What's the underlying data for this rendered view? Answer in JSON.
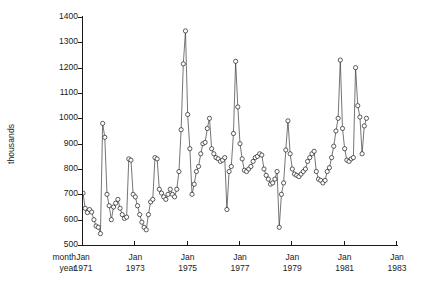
{
  "chart_data": {
    "type": "line",
    "title": "",
    "subtitle": "",
    "xlabel": "",
    "ylabel": "thousands",
    "row_labels": [
      "month",
      "year"
    ],
    "grid": false,
    "legend": "none",
    "markers": "open-circle",
    "ylim": [
      500,
      1400
    ],
    "yticks": [
      500,
      600,
      700,
      800,
      900,
      1000,
      1100,
      1200,
      1300,
      1400
    ],
    "ytick_labels": [
      "500",
      "600",
      "700",
      "800",
      "900",
      "1000",
      "1100",
      "1200",
      "1300",
      "1400"
    ],
    "xticks": [
      {
        "month": "Jan",
        "year": "1971",
        "index": 0
      },
      {
        "month": "Jan",
        "year": "1973",
        "index": 24
      },
      {
        "month": "Jan",
        "year": "1975",
        "index": 48
      },
      {
        "month": "Jan",
        "year": "1977",
        "index": 72
      },
      {
        "month": "Jan",
        "year": "1979",
        "index": 96
      },
      {
        "month": "Jan",
        "year": "1981",
        "index": 120
      },
      {
        "month": "Jan",
        "year": "1983",
        "index": 144
      }
    ],
    "xlim_index": [
      0,
      144
    ],
    "x_start": "Jan 1971",
    "x_end": "Dec 1982",
    "n_points": 131,
    "units": "thousands",
    "value_range": [
      540,
      1345
    ],
    "x": [
      0,
      1,
      2,
      3,
      4,
      5,
      6,
      7,
      8,
      9,
      10,
      11,
      12,
      13,
      14,
      15,
      16,
      17,
      18,
      19,
      20,
      21,
      22,
      23,
      24,
      25,
      26,
      27,
      28,
      29,
      30,
      31,
      32,
      33,
      34,
      35,
      36,
      37,
      38,
      39,
      40,
      41,
      42,
      43,
      44,
      45,
      46,
      47,
      48,
      49,
      50,
      51,
      52,
      53,
      54,
      55,
      56,
      57,
      58,
      59,
      60,
      61,
      62,
      63,
      64,
      65,
      66,
      67,
      68,
      69,
      70,
      71,
      72,
      73,
      74,
      75,
      76,
      77,
      78,
      79,
      80,
      81,
      82,
      83,
      84,
      85,
      86,
      87,
      88,
      89,
      90,
      91,
      92,
      93,
      94,
      95,
      96,
      97,
      98,
      99,
      100,
      101,
      102,
      103,
      104,
      105,
      106,
      107,
      108,
      109,
      110,
      111,
      112,
      113,
      114,
      115,
      116,
      117,
      118,
      119,
      120,
      121,
      122,
      123,
      124,
      125,
      126,
      127,
      128,
      129,
      130
    ],
    "values": [
      705,
      645,
      628,
      640,
      630,
      600,
      575,
      570,
      545,
      980,
      925,
      700,
      655,
      600,
      650,
      665,
      680,
      645,
      620,
      605,
      610,
      840,
      835,
      700,
      690,
      655,
      620,
      590,
      570,
      560,
      620,
      670,
      680,
      845,
      840,
      720,
      705,
      690,
      680,
      700,
      720,
      700,
      690,
      720,
      790,
      955,
      1215,
      1345,
      1015,
      880,
      700,
      740,
      790,
      810,
      860,
      900,
      905,
      960,
      1000,
      880,
      860,
      845,
      840,
      830,
      835,
      845,
      640,
      790,
      810,
      940,
      1225,
      1045,
      900,
      840,
      795,
      790,
      800,
      810,
      830,
      845,
      850,
      860,
      855,
      800,
      775,
      760,
      740,
      745,
      760,
      790,
      570,
      700,
      745,
      875,
      990,
      860,
      800,
      780,
      775,
      770,
      780,
      790,
      800,
      830,
      845,
      860,
      870,
      790,
      760,
      755,
      745,
      755,
      790,
      805,
      845,
      890,
      950,
      1000,
      1230,
      960,
      880,
      835,
      830,
      840,
      845,
      1200,
      1050,
      1005,
      860,
      970,
      1000
    ]
  }
}
